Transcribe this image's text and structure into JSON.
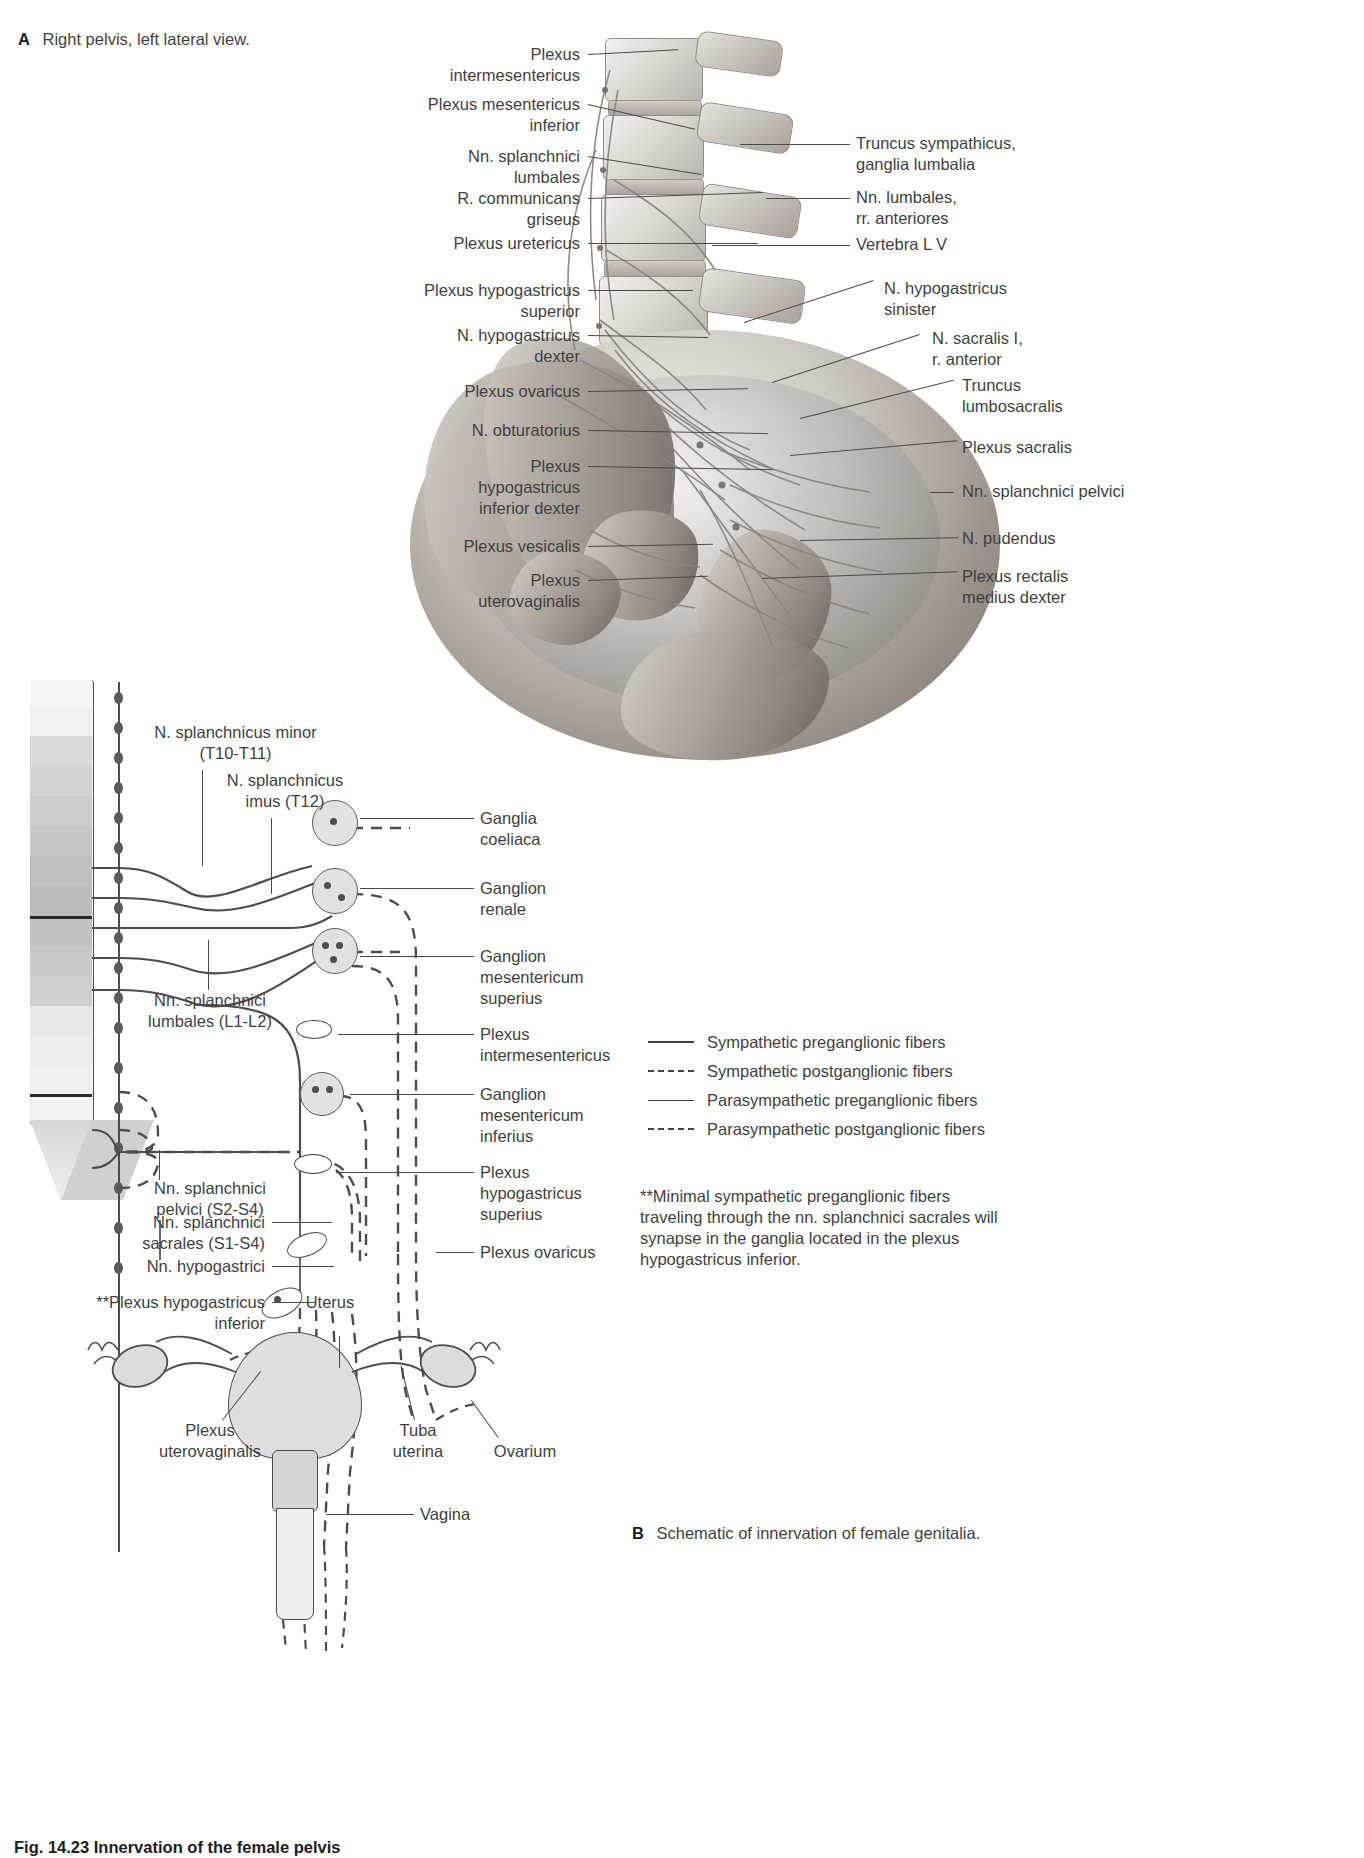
{
  "figure": {
    "caption": "Fig. 14.23 Innervation of the female pelvis"
  },
  "panel_a": {
    "letter": "A",
    "caption": "Right pelvis, left lateral view.",
    "labels_left": [
      {
        "text": "Plexus\nintermesentericus",
        "id": "plexus-intermesentericus"
      },
      {
        "text": "Plexus mesentericus\ninferior",
        "id": "plexus-mesentericus-inferior"
      },
      {
        "text": "Nn. splanchnici\nlumbales",
        "id": "nn-splanchnici-lumbales"
      },
      {
        "text": "R. communicans\ngriseus",
        "id": "r-communicans-griseus"
      },
      {
        "text": "Plexus uretericus",
        "id": "plexus-uretericus"
      },
      {
        "text": "Plexus hypogastricus\nsuperior",
        "id": "plexus-hypogastricus-superior"
      },
      {
        "text": "N. hypogastricus\ndexter",
        "id": "n-hypogastricus-dexter"
      },
      {
        "text": "Plexus ovaricus",
        "id": "plexus-ovaricus"
      },
      {
        "text": "N. obturatorius",
        "id": "n-obturatorius"
      },
      {
        "text": "Plexus\nhypogastricus\ninferior dexter",
        "id": "plexus-hypogastricus-inferior-dexter"
      },
      {
        "text": "Plexus vesicalis",
        "id": "plexus-vesicalis"
      },
      {
        "text": "Plexus\nuterovaginalis",
        "id": "plexus-uterovaginalis-a"
      }
    ],
    "labels_right": [
      {
        "text": "Truncus sympathicus,\nganglia lumbalia",
        "id": "truncus-sympathicus"
      },
      {
        "text": "Nn. lumbales,\nrr. anteriores",
        "id": "nn-lumbales-rr-anteriores"
      },
      {
        "text": "Vertebra L V",
        "id": "vertebra-lv"
      },
      {
        "text": "N. hypogastricus\nsinister",
        "id": "n-hypogastricus-sinister"
      },
      {
        "text": "N. sacralis I,\nr. anterior",
        "id": "n-sacralis-i"
      },
      {
        "text": "Truncus\nlumbosacralis",
        "id": "truncus-lumbosacralis"
      },
      {
        "text": "Plexus sacralis",
        "id": "plexus-sacralis"
      },
      {
        "text": "Nn. splanchnici pelvici",
        "id": "nn-splanchnici-pelvici-a"
      },
      {
        "text": "N. pudendus",
        "id": "n-pudendus"
      },
      {
        "text": "Plexus rectalis\nmedius dexter",
        "id": "plexus-rectalis-medius-dexter"
      }
    ]
  },
  "panel_b": {
    "letter": "B",
    "caption": "Schematic of innervation of female genitalia.",
    "labels_left": [
      {
        "text": "N. splanchnicus minor\n(T10-T11)",
        "id": "n-splanchnicus-minor"
      },
      {
        "text": "N. splanchnicus\nimus (T12)",
        "id": "n-splanchnicus-imus"
      },
      {
        "text": "Nn. splanchnici\nlumbales (L1-L2)",
        "id": "nn-splanchnici-lumbales-b"
      },
      {
        "text": "Nn. splanchnici\npelvici (S2-S4)",
        "id": "nn-splanchnici-pelvici-b"
      },
      {
        "text": "Nn. splanchnici\nsacrales (S1-S4)",
        "id": "nn-splanchnici-sacrales"
      },
      {
        "text": "Nn. hypogastrici",
        "id": "nn-hypogastrici"
      },
      {
        "text": "**Plexus hypogastricus\ninferior",
        "id": "plexus-hypogastricus-inferior-b"
      }
    ],
    "labels_right": [
      {
        "text": "Ganglia\ncoeliaca",
        "id": "ganglia-coeliaca"
      },
      {
        "text": "Ganglion\nrenale",
        "id": "ganglion-renale"
      },
      {
        "text": "Ganglion\nmesentericum\nsuperius",
        "id": "ganglion-mesentericum-superius"
      },
      {
        "text": "Plexus\nintermesentericus",
        "id": "plexus-intermesentericus-b"
      },
      {
        "text": "Ganglion\nmesentericum\ninferius",
        "id": "ganglion-mesentericum-inferius"
      },
      {
        "text": "Plexus\nhypogastricus\nsuperius",
        "id": "plexus-hypogastricus-superius-b"
      },
      {
        "text": "Plexus ovaricus",
        "id": "plexus-ovaricus-b"
      }
    ],
    "organ_labels": [
      {
        "text": "Uterus",
        "id": "uterus"
      },
      {
        "text": "Plexus\nuterovaginalis",
        "id": "plexus-uterovaginalis-b"
      },
      {
        "text": "Tuba\nuterina",
        "id": "tuba-uterina"
      },
      {
        "text": "Ovarium",
        "id": "ovarium"
      },
      {
        "text": "Vagina",
        "id": "vagina"
      }
    ]
  },
  "legend": {
    "items": [
      {
        "label": "Sympathetic preganglionic fibers",
        "style": "solid"
      },
      {
        "label": "Sympathetic postganglionic fibers",
        "style": "dashed"
      },
      {
        "label": "Parasympathetic preganglionic fibers",
        "style": "solid-thin"
      },
      {
        "label": "Parasympathetic postganglionic fibers",
        "style": "dashed"
      }
    ],
    "footnote": "**Minimal sympathetic preganglionic fibers traveling through the nn. splanchnici sacrales will synapse in the ganglia located in the plexus hypogastricus inferior."
  },
  "colors": {
    "ink": "#3f3f3f",
    "line": "#4d4d4d",
    "bone_light": "#f2efeb",
    "bone_mid": "#cfcac3",
    "bone_dark": "#6f6a64"
  }
}
